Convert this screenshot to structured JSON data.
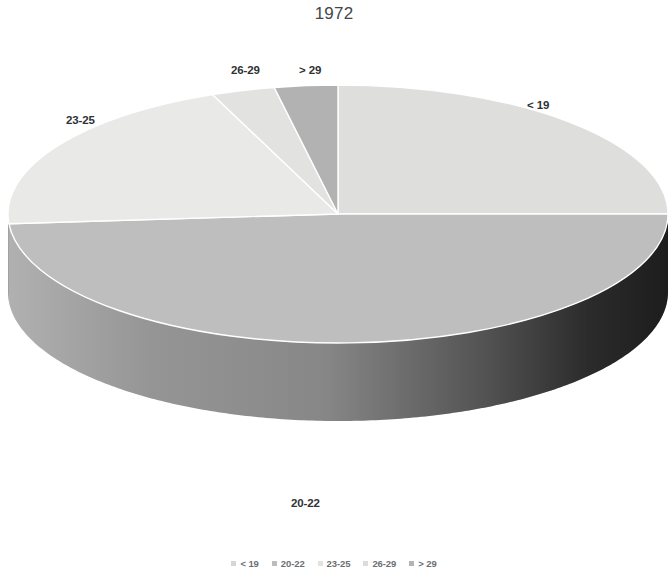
{
  "chart_data": {
    "type": "pie",
    "title": "1972",
    "subtitle": "",
    "xlabel": "",
    "ylabel": "",
    "three_d": true,
    "grid": false,
    "legend_position": "bottom",
    "categories": [
      "< 19",
      "20-22",
      "23-25",
      "26-29",
      "> 29"
    ],
    "values": [
      25.0,
      48.8,
      20.0,
      3.1,
      3.1
    ],
    "labels": [
      "< 19",
      "20-22",
      "23-25",
      "26-29",
      "> 29"
    ],
    "colors": [
      "#dededd",
      "#bebebe",
      "#e9e9e8",
      "#e2e2e1",
      "#b2b2b2"
    ],
    "side_colors": [
      "#9a9a9a",
      "#8f8f8f",
      "#b4b4b4",
      "#aeaeae",
      "#8a8a8a"
    ],
    "annotations": [
      {
        "text": "< 19",
        "position": "right"
      },
      {
        "text": "20-22",
        "position": "bottom"
      },
      {
        "text": "23-25",
        "position": "upper-left"
      },
      {
        "text": "26-29",
        "position": "top-left"
      },
      {
        "text": "> 29",
        "position": "top"
      }
    ]
  },
  "title": {
    "text": "1972"
  },
  "labels": {
    "lt19": "< 19",
    "b2022": "20-22",
    "b2325": "23-25",
    "b2629": "26-29",
    "gt29": "> 29"
  },
  "legend": {
    "items": [
      {
        "label": "< 19",
        "color": "#d6d6d5"
      },
      {
        "label": "20-22",
        "color": "#bdbdbd"
      },
      {
        "label": "23-25",
        "color": "#e2e2e1"
      },
      {
        "label": "26-29",
        "color": "#dcdcdb"
      },
      {
        "label": "> 29",
        "color": "#b4b4b4"
      }
    ]
  },
  "geometry": {
    "cx": 338,
    "cy": 214,
    "rx": 330,
    "ry": 129,
    "depth": 78,
    "start_angle_deg": -90
  }
}
